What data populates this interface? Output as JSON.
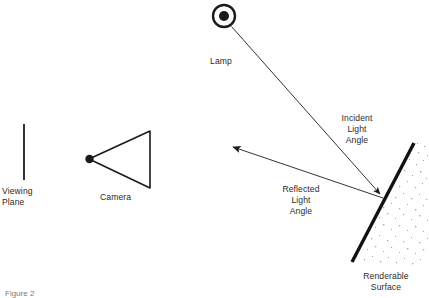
{
  "figure": {
    "caption": "Figure 2",
    "background_color": "#ffffff",
    "ink_color": "#1a1a1a",
    "text_color": "#2b2b2b",
    "stipple_color": "#9a9a9a"
  },
  "labels": {
    "viewing_plane": "Viewing\nPlane",
    "camera": "Camera",
    "lamp": "Lamp",
    "incident_light_angle": "Incident\nLight\nAngle",
    "reflected_light_angle": "Reflected\nLight\nAngle",
    "renderable_surface": "Renderable\nSurface"
  },
  "elements": {
    "viewing_plane": {
      "name": "viewing-plane-line",
      "x": 24,
      "y1": 124,
      "y2": 180
    },
    "camera": {
      "name": "camera-triangle",
      "apex_x": 89,
      "apex_y": 159,
      "back_x": 150,
      "top_y": 131,
      "bottom_y": 188
    },
    "lamp": {
      "name": "lamp-symbol",
      "cx": 224,
      "cy": 16,
      "outer_r": 11.5,
      "inner_r": 5
    },
    "surface": {
      "name": "renderable-surface-line",
      "x1": 352,
      "y1": 262,
      "x2": 414,
      "y2": 143,
      "width": 3.4
    },
    "incident_ray": {
      "name": "incident-ray",
      "from_x": 230,
      "from_y": 27,
      "to_x": 383,
      "to_y": 197
    },
    "reflected_ray": {
      "name": "reflected-ray",
      "from_x": 383,
      "from_y": 197,
      "to_x": 229,
      "to_y": 145
    }
  },
  "label_positions": {
    "viewing_plane": {
      "x": 2,
      "y": 186
    },
    "camera": {
      "x": 100,
      "y": 192
    },
    "lamp": {
      "x": 210,
      "y": 56
    },
    "incident_light_angle": {
      "x": 338,
      "y": 114
    },
    "reflected_light_angle": {
      "x": 276,
      "y": 184
    },
    "renderable_surface": {
      "x": 358,
      "y": 272
    },
    "caption": {
      "x": 5,
      "y": 288
    }
  }
}
